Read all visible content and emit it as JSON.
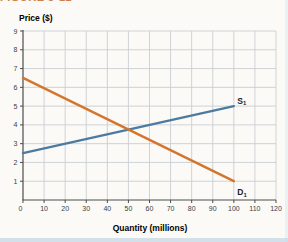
{
  "figure": {
    "heading_clipped": "FIGURE 3-12",
    "y_axis_title": "Price ($)",
    "x_axis_title": "Quantity (millions)"
  },
  "chart_data": {
    "type": "line",
    "title": "",
    "xlabel": "Quantity (millions)",
    "ylabel": "Price ($)",
    "xlim": [
      0,
      120
    ],
    "xtick_step": 10,
    "ylim": [
      0,
      9
    ],
    "ytick_step": 1,
    "grid": true,
    "legend_position": "labels at right end of each line",
    "series": [
      {
        "name": "S1",
        "label": "S",
        "subscript": "1",
        "color": "#4d7aa0",
        "label_side": "above",
        "points": [
          [
            0,
            2.5
          ],
          [
            100,
            5
          ]
        ]
      },
      {
        "name": "D1",
        "label": "D",
        "subscript": "1",
        "color": "#d4752e",
        "label_side": "below",
        "points": [
          [
            0,
            6.5
          ],
          [
            100,
            1
          ]
        ]
      }
    ]
  },
  "colors": {
    "grid": "#c9ced3",
    "axis": "#4c4c4c",
    "tick_text": "#3d3d3d",
    "axis_title": "#2f2f2f",
    "series_label": "#1c2430",
    "heading": "#c96a2a",
    "page_bg": "#fbfaf6",
    "edge_band": "#cddbe6"
  }
}
